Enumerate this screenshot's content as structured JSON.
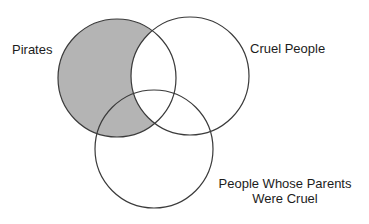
{
  "diagram": {
    "type": "venn",
    "sets": [
      {
        "id": "pirates",
        "label": "Pirates",
        "cx": 117,
        "cy": 78,
        "r": 59
      },
      {
        "id": "cruel",
        "label": "Cruel People",
        "cx": 190,
        "cy": 76,
        "r": 59
      },
      {
        "id": "parents",
        "label_lines": [
          "People Whose Parents",
          "Were Cruel"
        ],
        "cx": 154,
        "cy": 149,
        "r": 59
      }
    ],
    "shaded_region": "pirates minus cruel",
    "colors": {
      "stroke": "#3a3a3a",
      "shade": "#b4b4b4",
      "background": "#ffffff"
    }
  }
}
